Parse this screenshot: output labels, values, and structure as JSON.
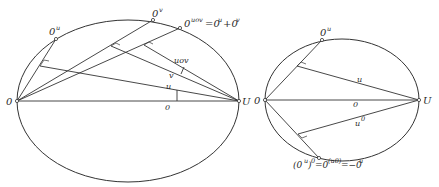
{
  "figure_left": {
    "points": {
      "origin": "0",
      "unit": "U",
      "ou": "0",
      "ou_sup": "u",
      "ov": "0",
      "ov_sup": "v",
      "ouov": "0",
      "ouov_sup": "uov",
      "ouov_eq": "=0",
      "ouov_eq_sup1": "u",
      "ouov_plus": "+0",
      "ouov_plus_sup": "v"
    },
    "segments": {
      "u": "u",
      "v": "v",
      "uov": "uov",
      "zero": "0"
    }
  },
  "figure_right": {
    "points": {
      "origin": "0",
      "unit": "U",
      "ou": "0",
      "ou_sup": "u",
      "bottom_open": "(0",
      "bottom_sup1": "u",
      "bottom_close": ")",
      "bottom_sup2": "0",
      "bottom_eq": "=0",
      "bottom_sup3": "(u0)",
      "bottom_eq2": "=−0",
      "bottom_sup4": "u"
    },
    "segments": {
      "u": "u",
      "u0": "u",
      "u0_sup": "0",
      "zero": "0"
    }
  }
}
